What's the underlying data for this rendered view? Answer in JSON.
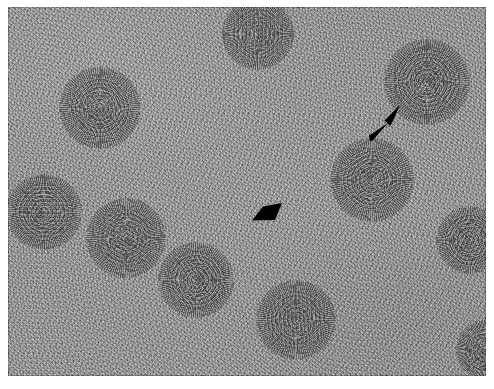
{
  "figure": {
    "kind": "transmission-electron-micrograph",
    "technique": "negative-stain",
    "background_color": "#9a9a9a",
    "frame_color": "#ffffff",
    "border_color": "#3c3c3c",
    "annotation_color": "#000000",
    "plate": {
      "x": 8,
      "y": 7,
      "width": 478,
      "height": 369
    }
  },
  "particles": [
    {
      "id": "particle-1",
      "cx": 100,
      "cy": 108,
      "r": 41,
      "label": "virus-particle"
    },
    {
      "id": "particle-2",
      "cx": 258,
      "cy": 34,
      "r": 36,
      "label": "virus-particle"
    },
    {
      "id": "particle-3",
      "cx": 427,
      "cy": 82,
      "r": 43,
      "label": "virus-particle"
    },
    {
      "id": "particle-4",
      "cx": 372,
      "cy": 180,
      "r": 42,
      "label": "virus-particle"
    },
    {
      "id": "particle-5",
      "cx": 44,
      "cy": 212,
      "r": 38,
      "label": "virus-particle"
    },
    {
      "id": "particle-6",
      "cx": 126,
      "cy": 238,
      "r": 40,
      "label": "virus-particle"
    },
    {
      "id": "particle-7",
      "cx": 196,
      "cy": 280,
      "r": 38,
      "label": "virus-particle"
    },
    {
      "id": "particle-8",
      "cx": 296,
      "cy": 320,
      "r": 40,
      "label": "virus-particle"
    },
    {
      "id": "particle-9",
      "cx": 470,
      "cy": 240,
      "r": 34,
      "label": "virus-particle"
    },
    {
      "id": "particle-10",
      "cx": 486,
      "cy": 350,
      "r": 30,
      "label": "virus-particle"
    }
  ],
  "annotations": [
    {
      "id": "arrow-marker",
      "name": "arrow-icon",
      "shape": "arrow",
      "description": "solid black arrow pointing up-right at a virus particle",
      "tail": {
        "x": 363,
        "y": 130
      },
      "tip": {
        "x": 390,
        "y": 101
      },
      "color": "#000000"
    },
    {
      "id": "arrowhead-marker",
      "name": "arrowhead-icon",
      "shape": "triangle",
      "description": "solid black arrowhead pointing down-left at background material",
      "tip": {
        "x": 251,
        "y": 213
      },
      "color": "#000000"
    }
  ]
}
